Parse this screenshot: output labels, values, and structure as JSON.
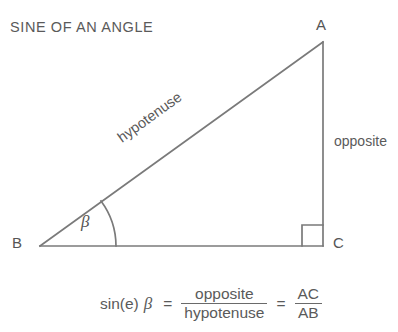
{
  "title": "SINE OF AN ANGLE",
  "diagram": {
    "type": "right-triangle",
    "vertices": [
      {
        "id": "A",
        "label": "A",
        "x": 323,
        "y": 42
      },
      {
        "id": "B",
        "label": "B",
        "x": 40,
        "y": 246
      },
      {
        "id": "C",
        "label": "C",
        "x": 323,
        "y": 246
      }
    ],
    "sides": [
      {
        "id": "hypotenuse",
        "label": "hypotenuse",
        "from": "B",
        "to": "A"
      },
      {
        "id": "opposite",
        "label": "opposite",
        "from": "A",
        "to": "C"
      },
      {
        "id": "adjacent",
        "label": "",
        "from": "B",
        "to": "C"
      }
    ],
    "angles": [
      {
        "id": "beta",
        "label": "β",
        "at": "B",
        "marker": "arc"
      },
      {
        "id": "right-angle",
        "label": "",
        "at": "C",
        "marker": "square"
      }
    ],
    "colors": {
      "stroke": "#7a7a7a",
      "text": "#5a5a5a",
      "background": "#ffffff"
    }
  },
  "formula": {
    "function": "sin(e)",
    "angle": "β",
    "equals_1": "=",
    "fraction_1": {
      "numerator": "opposite",
      "denominator": "hypotenuse"
    },
    "equals_2": "=",
    "fraction_2": {
      "numerator": "AC",
      "denominator": "AB"
    }
  }
}
